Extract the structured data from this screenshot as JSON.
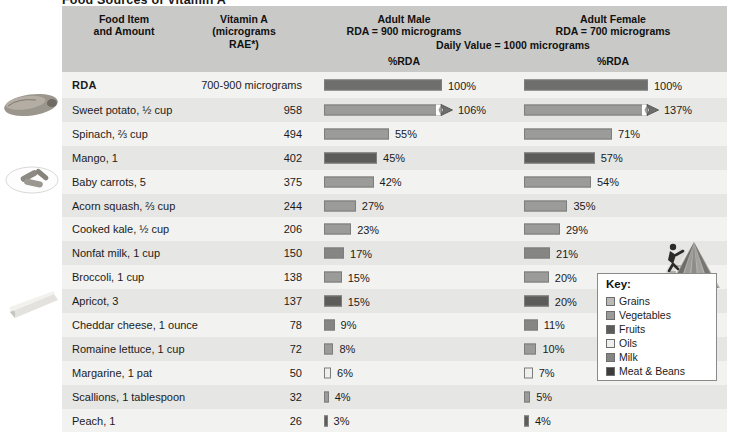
{
  "title": "Food Sources of Vitamin A",
  "header": {
    "food_item": "Food Item\nand Amount",
    "food_item_l1": "Food Item",
    "food_item_l2": "and Amount",
    "vitamin_l1": "Vitamin A",
    "vitamin_l2": "(micrograms",
    "vitamin_l3": "RAE*)",
    "male_l1": "Adult Male",
    "male_l2": "RDA = 900 micrograms",
    "female_l1": "Adult Female",
    "female_l2": "RDA = 700 micrograms",
    "daily_value": "Daily Value = 1000 micrograms",
    "pct_rda_male": "%RDA",
    "pct_rda_female": "%RDA"
  },
  "key": {
    "title": "Key:",
    "items": [
      {
        "label": "Grains",
        "color": "#b9b9b7"
      },
      {
        "label": "Vegetables",
        "color": "#9b9b99"
      },
      {
        "label": "Fruits",
        "color": "#5c5c5a"
      },
      {
        "label": "Oils",
        "color": "#efefed"
      },
      {
        "label": "Milk",
        "color": "#858583"
      },
      {
        "label": "Meat & Beans",
        "color": "#3d3d3b"
      }
    ]
  },
  "images": [
    {
      "name": "sweet-potato-photo",
      "alt": "sweet potato"
    },
    {
      "name": "baby-carrots-photo",
      "alt": "baby carrots on a plate"
    },
    {
      "name": "cheddar-cheese-photo",
      "alt": "wedge of cheddar cheese"
    },
    {
      "name": "mypyramid-logo",
      "alt": "MyPyramid logo with figure climbing steps"
    }
  ],
  "chart_data": {
    "type": "bar",
    "title": "Food Sources of Vitamin A",
    "xlabel": "%RDA",
    "ylabel": "Food Item and Amount",
    "xlim": [
      0,
      110
    ],
    "grid": false,
    "legend": [
      "Grains",
      "Vegetables",
      "Fruits",
      "Oils",
      "Milk",
      "Meat & Beans"
    ],
    "legend_position": "right",
    "units": "micrograms RAE",
    "reference": {
      "male_rda": 900,
      "female_rda": 700,
      "daily_value": 1000
    },
    "categories": [
      "RDA",
      "Sweet potato, ½ cup",
      "Spinach, ⅔ cup",
      "Mango, 1",
      "Baby carrots, 5",
      "Acorn squash, ⅔ cup",
      "Cooked kale, ½ cup",
      "Nonfat milk, 1 cup",
      "Broccoli, 1 cup",
      "Apricot, 3",
      "Cheddar cheese, 1 ounce",
      "Romaine lettuce, 1 cup",
      "Margarine, 1 pat",
      "Scallions, 1 tablespoon",
      "Peach, 1"
    ],
    "series": [
      {
        "name": "Vitamin A (micrograms RAE)",
        "values": [
          null,
          958,
          494,
          402,
          375,
          244,
          206,
          150,
          138,
          137,
          78,
          72,
          50,
          32,
          26
        ]
      },
      {
        "name": "Adult Male %RDA",
        "values": [
          100,
          106,
          55,
          45,
          42,
          27,
          23,
          17,
          15,
          15,
          9,
          8,
          6,
          4,
          3
        ]
      },
      {
        "name": "Adult Female %RDA",
        "values": [
          100,
          137,
          71,
          57,
          54,
          35,
          29,
          21,
          20,
          20,
          11,
          10,
          7,
          5,
          4
        ]
      }
    ],
    "rows": [
      {
        "name": "RDA",
        "amount": "700-900 micrograms",
        "group": "rda",
        "male_pct": 100,
        "male_label": "100%",
        "male_bar": 100,
        "male_over": false,
        "female_pct": 100,
        "female_label": "100%",
        "female_bar": 100,
        "female_over": false
      },
      {
        "name": "Sweet potato, ½ cup",
        "amount": "958",
        "group": "vegetables",
        "male_pct": 106,
        "male_label": "106%",
        "male_bar": 100,
        "male_over": true,
        "female_pct": 137,
        "female_label": "137%",
        "female_bar": 100,
        "female_over": true
      },
      {
        "name": "Spinach, ⅔ cup",
        "amount": "494",
        "group": "vegetables",
        "male_pct": 55,
        "male_label": "55%",
        "male_bar": 55,
        "male_over": false,
        "female_pct": 71,
        "female_label": "71%",
        "female_bar": 71,
        "female_over": false
      },
      {
        "name": "Mango, 1",
        "amount": "402",
        "group": "fruits",
        "male_pct": 45,
        "male_label": "45%",
        "male_bar": 45,
        "male_over": false,
        "female_pct": 57,
        "female_label": "57%",
        "female_bar": 57,
        "female_over": false
      },
      {
        "name": "Baby carrots, 5",
        "amount": "375",
        "group": "vegetables",
        "male_pct": 42,
        "male_label": "42%",
        "male_bar": 42,
        "male_over": false,
        "female_pct": 54,
        "female_label": "54%",
        "female_bar": 54,
        "female_over": false
      },
      {
        "name": "Acorn squash, ⅔ cup",
        "amount": "244",
        "group": "vegetables",
        "male_pct": 27,
        "male_label": "27%",
        "male_bar": 27,
        "male_over": false,
        "female_pct": 35,
        "female_label": "35%",
        "female_bar": 35,
        "female_over": false
      },
      {
        "name": "Cooked kale, ½ cup",
        "amount": "206",
        "group": "vegetables",
        "male_pct": 23,
        "male_label": "23%",
        "male_bar": 23,
        "male_over": false,
        "female_pct": 29,
        "female_label": "29%",
        "female_bar": 29,
        "female_over": false
      },
      {
        "name": "Nonfat milk, 1 cup",
        "amount": "150",
        "group": "milk",
        "male_pct": 17,
        "male_label": "17%",
        "male_bar": 17,
        "male_over": false,
        "female_pct": 21,
        "female_label": "21%",
        "female_bar": 21,
        "female_over": false
      },
      {
        "name": "Broccoli, 1 cup",
        "amount": "138",
        "group": "vegetables",
        "male_pct": 15,
        "male_label": "15%",
        "male_bar": 15,
        "male_over": false,
        "female_pct": 20,
        "female_label": "20%",
        "female_bar": 20,
        "female_over": false
      },
      {
        "name": "Apricot, 3",
        "amount": "137",
        "group": "fruits",
        "male_pct": 15,
        "male_label": "15%",
        "male_bar": 15,
        "male_over": false,
        "female_pct": 20,
        "female_label": "20%",
        "female_bar": 20,
        "female_over": false
      },
      {
        "name": "Cheddar cheese, 1 ounce",
        "amount": "78",
        "group": "milk",
        "male_pct": 9,
        "male_label": "9%",
        "male_bar": 9,
        "male_over": false,
        "female_pct": 11,
        "female_label": "11%",
        "female_bar": 11,
        "female_over": false
      },
      {
        "name": "Romaine lettuce, 1 cup",
        "amount": "72",
        "group": "vegetables",
        "male_pct": 8,
        "male_label": "8%",
        "male_bar": 8,
        "male_over": false,
        "female_pct": 10,
        "female_label": "10%",
        "female_bar": 10,
        "female_over": false
      },
      {
        "name": "Margarine, 1 pat",
        "amount": "50",
        "group": "oils",
        "male_pct": 6,
        "male_label": "6%",
        "male_bar": 6,
        "male_over": false,
        "female_pct": 7,
        "female_label": "7%",
        "female_bar": 7,
        "female_over": false
      },
      {
        "name": "Scallions, 1 tablespoon",
        "amount": "32",
        "group": "vegetables",
        "male_pct": 4,
        "male_label": "4%",
        "male_bar": 4,
        "male_over": false,
        "female_pct": 5,
        "female_label": "5%",
        "female_bar": 5,
        "female_over": false
      },
      {
        "name": "Peach, 1",
        "amount": "26",
        "group": "fruits",
        "male_pct": 3,
        "male_label": "3%",
        "male_bar": 3,
        "male_over": false,
        "female_pct": 4,
        "female_label": "4%",
        "female_bar": 4,
        "female_over": false
      }
    ]
  }
}
